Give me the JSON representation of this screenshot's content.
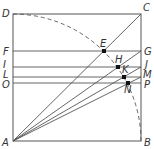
{
  "diagram": {
    "title": "",
    "square": {
      "corners": {
        "A": {
          "x": 13,
          "y": 141
        },
        "B": {
          "x": 141,
          "y": 141
        },
        "C": {
          "x": 141,
          "y": 14
        },
        "D": {
          "x": 13,
          "y": 14
        }
      }
    },
    "arc": {
      "center": "A",
      "from": "D",
      "to": "B",
      "style": "dashed"
    },
    "horizontal_lines": [
      {
        "left": "F",
        "right": "G",
        "y": 51
      },
      {
        "left": "I",
        "right": "J",
        "y": 67
      },
      {
        "left": "L",
        "right": "M",
        "y": 77
      },
      {
        "left": "O",
        "right": "P",
        "y": 83
      }
    ],
    "rays_from_A": [
      "C",
      "G",
      "J",
      "M"
    ],
    "points": [
      {
        "label": "E",
        "x": 104,
        "y": 51
      },
      {
        "label": "H",
        "x": 118,
        "y": 67
      },
      {
        "label": "K",
        "x": 124,
        "y": 77
      },
      {
        "label": "N",
        "x": 128,
        "y": 83
      }
    ],
    "labels": {
      "A": "A",
      "B": "B",
      "C": "C",
      "D": "D",
      "E": "E",
      "F": "F",
      "G": "G",
      "H": "H",
      "I": "I",
      "J": "J",
      "K": "K",
      "L": "L",
      "M": "M",
      "N": "N",
      "O": "O",
      "P": "P"
    },
    "colors": {
      "line": "#555555",
      "text": "#333333",
      "point": "#111111"
    }
  }
}
